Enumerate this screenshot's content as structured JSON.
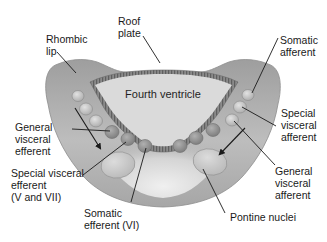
{
  "diagram": {
    "center_label": "Fourth ventricle",
    "colors": {
      "background": "#ffffff",
      "tissue_outer": "#a9a9a9",
      "tissue_inner": "#e9e9e9",
      "ventricle_fill": "#d9d9d9",
      "roof_plate": "#7c7c7c",
      "nucleus_dark": "#8d8d8d",
      "nucleus_light": "#c6c6c6",
      "line": "#1a1a1a"
    },
    "labels": {
      "rhombic_lip": [
        "Rhombic",
        "lip"
      ],
      "roof_plate": [
        "Roof",
        "plate"
      ],
      "somatic_afferent": [
        "Somatic",
        "afferent"
      ],
      "general_visceral_efferent": [
        "General",
        "visceral",
        "efferent"
      ],
      "special_visceral_afferent": [
        "Special",
        "visceral",
        "afferent"
      ],
      "special_visceral_efferent": [
        "Special visceral",
        "efferent",
        "(V and VII)"
      ],
      "general_visceral_afferent": [
        "General",
        "visceral",
        "afferent"
      ],
      "somatic_efferent": [
        "Somatic",
        "efferent (VI)"
      ],
      "pontine_nuclei": [
        "Pontine nuclei"
      ]
    }
  }
}
